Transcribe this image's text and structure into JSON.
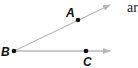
{
  "diagram": {
    "type": "angle",
    "vertex": {
      "label": "B",
      "x": 14,
      "y": 51
    },
    "points": [
      {
        "label": "A",
        "x": 78,
        "y": 20,
        "label_x": 66,
        "label_y": 17
      },
      {
        "label": "C",
        "x": 86,
        "y": 51,
        "label_x": 83,
        "label_y": 66
      }
    ],
    "rays": [
      {
        "from": "B",
        "through": "A",
        "x2": 110,
        "y2": 5
      },
      {
        "from": "B",
        "through": "C",
        "x2": 110,
        "y2": 51
      }
    ],
    "ray_color": "#b8b8b8",
    "point_color": "#111111",
    "vertex_label_pos": {
      "x": 1,
      "y": 56
    },
    "cut_text": "ar"
  }
}
